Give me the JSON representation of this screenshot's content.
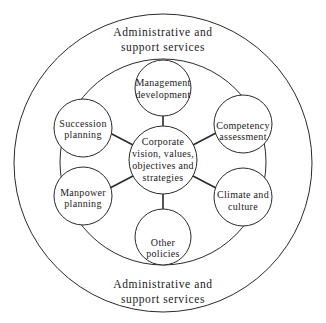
{
  "diagram": {
    "outer_ring": {
      "label_top": [
        "Administrative and",
        "support services"
      ],
      "label_bottom": [
        "Administrative and",
        "support services"
      ]
    },
    "center": {
      "label": [
        "Corporate",
        "vision, values,",
        "objectives and",
        "strategies"
      ]
    },
    "nodes": [
      {
        "id": "management-development",
        "label": [
          "Management",
          "development"
        ]
      },
      {
        "id": "competency-assessment",
        "label": [
          "Competency",
          "assessment"
        ]
      },
      {
        "id": "climate-and-culture",
        "label": [
          "Climate and",
          "culture"
        ]
      },
      {
        "id": "other-policies",
        "label": [
          "Other",
          "policies"
        ]
      },
      {
        "id": "manpower-planning",
        "label": [
          "Manpower",
          "planning"
        ]
      },
      {
        "id": "succession-planning",
        "label": [
          "Succession",
          "planning"
        ]
      }
    ],
    "colors": {
      "stroke": "#2a2a2a",
      "text": "#1a1a1a",
      "background": "#ffffff"
    }
  }
}
